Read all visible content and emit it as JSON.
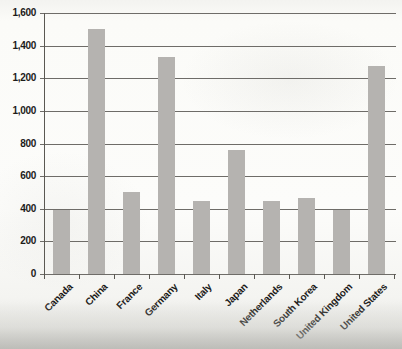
{
  "window": {
    "width": 402,
    "height": 349
  },
  "chart_data": {
    "type": "bar",
    "title": "",
    "categories": [
      "Canada",
      "China",
      "France",
      "Germany",
      "Italy",
      "Japan",
      "Netherlands",
      "South Korea",
      "United Kingdom",
      "United States"
    ],
    "values": [
      390,
      1500,
      500,
      1330,
      450,
      760,
      450,
      465,
      390,
      1275
    ],
    "xlabel": "",
    "ylabel": "",
    "ylim": [
      0,
      1600
    ],
    "ytick_step": 200,
    "ytick_labels": [
      "0",
      "200",
      "400",
      "600",
      "800",
      "1,000",
      "1,200",
      "1,400",
      "1,600"
    ],
    "grid": true,
    "legend_position": "none",
    "bar_color": "#b5b3b0",
    "gridline_color": "#6e6c68",
    "axis_color": "#5a5852",
    "text_color": "#1c1b19",
    "background": "#fbfbf8",
    "scan_shadow_color": "#c6c6c2"
  }
}
